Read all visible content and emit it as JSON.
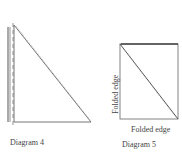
{
  "diagrams": [
    {
      "caption": "Diagram 4"
    },
    {
      "caption": "Diagram 5",
      "left_edge_label": "Folded edge",
      "bottom_edge_label": "Folded edge"
    }
  ]
}
